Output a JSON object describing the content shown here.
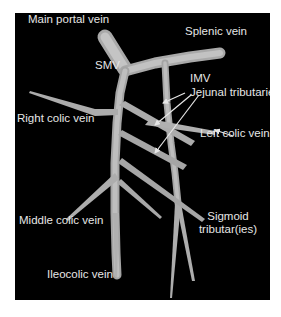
{
  "figure": {
    "background_color": "#000000",
    "vessel_color": "#b8b8b8",
    "label_color": "#e6e6e6",
    "arrow_color": "#e6e6e6"
  },
  "labels": {
    "main_portal_vein": "Main portal vein",
    "splenic_vein": "Splenic vein",
    "smv": "SMV",
    "imv": "IMV",
    "jejunal_tributaries": "Jejunal tributaries",
    "right_colic_vein": "Right colic vein",
    "left_colic_vein": "Left colic vein",
    "middle_colic_vein": "Middle colic vein",
    "sigmoid_line1": "Sigmoid",
    "sigmoid_line2": "tributar(ies)",
    "ileocolic_vein": "Ileocolic vein"
  }
}
